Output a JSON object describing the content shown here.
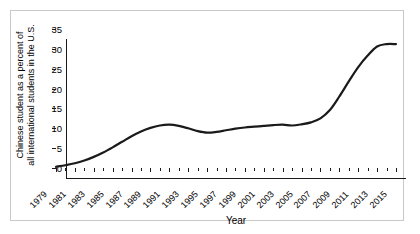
{
  "chart_data": {
    "type": "line",
    "title": "",
    "xlabel": "Year",
    "ylabel_line1": "Chinese student as a percent of",
    "ylabel_line2": "all international students in the U.S.",
    "ylim": [
      0,
      35
    ],
    "yticks": [
      0,
      5,
      10,
      15,
      20,
      25,
      30,
      35
    ],
    "xlim": [
      1979,
      2015
    ],
    "xticks": [
      1979,
      1981,
      1983,
      1985,
      1987,
      1989,
      1991,
      1993,
      1995,
      1997,
      1999,
      2001,
      2003,
      2005,
      2007,
      2009,
      2011,
      2013,
      2015
    ],
    "grid": false,
    "legend": null,
    "series": [
      {
        "name": "Chinese students share of U.S. international students",
        "color": "#1a1a1a",
        "x": [
          1979,
          1980,
          1981,
          1982,
          1983,
          1984,
          1985,
          1986,
          1987,
          1988,
          1989,
          1990,
          1991,
          1992,
          1993,
          1994,
          1995,
          1996,
          1997,
          1998,
          1999,
          2000,
          2001,
          2002,
          2003,
          2004,
          2005,
          2006,
          2007,
          2008,
          2009,
          2010,
          2011,
          2012,
          2013,
          2014,
          2015
        ],
        "values": [
          0.3,
          0.7,
          1.2,
          1.9,
          2.8,
          3.9,
          5.2,
          6.6,
          8.0,
          9.2,
          10.1,
          10.7,
          10.9,
          10.6,
          10.0,
          9.3,
          8.9,
          9.1,
          9.5,
          9.9,
          10.2,
          10.4,
          10.6,
          10.8,
          10.9,
          10.7,
          11.0,
          11.5,
          12.5,
          14.6,
          18.0,
          21.8,
          25.4,
          28.3,
          30.6,
          31.2,
          31.2
        ]
      }
    ]
  },
  "axis": {
    "y_tick_labels": [
      "0",
      "5",
      "10",
      "15",
      "20",
      "25",
      "30",
      "35"
    ],
    "x_tick_labels": [
      "1979",
      "1981",
      "1983",
      "1985",
      "1987",
      "1989",
      "1991",
      "1993",
      "1995",
      "1997",
      "1999",
      "2001",
      "2003",
      "2005",
      "2007",
      "2009",
      "2011",
      "2013",
      "2015"
    ]
  }
}
